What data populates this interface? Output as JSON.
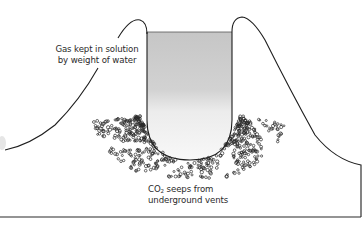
{
  "diagram": {
    "title": "",
    "labels": {
      "gas_in_solution": {
        "line1": "Gas kept in solution",
        "line2": "by weight of water"
      },
      "co2_seeps": {
        "prefix": "CO",
        "subscript": "2",
        "line1_rest": " seeps from",
        "line2": "underground vents"
      }
    },
    "elements": [
      "lake-basin",
      "crater-rim-left",
      "crater-rim-right",
      "co2-bubbles",
      "ground-baseline"
    ],
    "colors": {
      "outline": "#1e1e1e",
      "water_top": "#c8c8c8",
      "water_bottom": "#f7f7f7",
      "bubbles": "#2a2a2a",
      "text": "#2a2a2a",
      "background": "#ffffff"
    }
  }
}
